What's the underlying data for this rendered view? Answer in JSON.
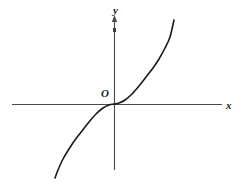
{
  "figure": {
    "background_color": "#ffffff",
    "stroke_color": "#1a1a1a",
    "axis_color": "#4a4a4a",
    "width": 242,
    "height": 196
  },
  "labels": {
    "y_axis": "y",
    "x_axis": "x",
    "origin": "O"
  },
  "chart_data": {
    "type": "line",
    "title": "",
    "xlabel": "x",
    "ylabel": "y",
    "origin_label": "O",
    "grid": false,
    "legend": null,
    "axes": {
      "x_axis_pixel_y": 104,
      "x_axis_pixel_x_start": 12,
      "x_axis_pixel_x_end": 222,
      "y_axis_pixel_x": 114,
      "y_axis_pixel_y_start": 16,
      "y_axis_pixel_y_end": 170,
      "x_arrow": false,
      "y_arrow": true
    },
    "xlim": [
      -1.0,
      1.0
    ],
    "ylim": [
      -1.0,
      1.0
    ],
    "series": [
      {
        "name": "curve",
        "x": [
          -0.58,
          -0.55,
          -0.5,
          -0.44,
          -0.38,
          -0.31,
          -0.24,
          -0.17,
          -0.1,
          -0.04,
          0.0,
          0.04,
          0.1,
          0.17,
          0.24,
          0.31,
          0.38,
          0.44,
          0.5,
          0.55,
          0.58
        ],
        "y": [
          -0.86,
          -0.78,
          -0.68,
          -0.58,
          -0.49,
          -0.4,
          -0.31,
          -0.22,
          -0.13,
          -0.05,
          0.0,
          0.05,
          0.13,
          0.22,
          0.31,
          0.4,
          0.49,
          0.58,
          0.68,
          0.78,
          0.86
        ],
        "pixel_points": [
          [
            55,
            178
          ],
          [
            58,
            170
          ],
          [
            63,
            159
          ],
          [
            69,
            149
          ],
          [
            75,
            140
          ],
          [
            82,
            131
          ],
          [
            89,
            122
          ],
          [
            96,
            114
          ],
          [
            103,
            108
          ],
          [
            109,
            105
          ],
          [
            114,
            104
          ],
          [
            119,
            103
          ],
          [
            125,
            100
          ],
          [
            132,
            94
          ],
          [
            139,
            86
          ],
          [
            146,
            77
          ],
          [
            153,
            68
          ],
          [
            159,
            59
          ],
          [
            165,
            48
          ],
          [
            170,
            37
          ],
          [
            174,
            20
          ]
        ]
      }
    ]
  }
}
